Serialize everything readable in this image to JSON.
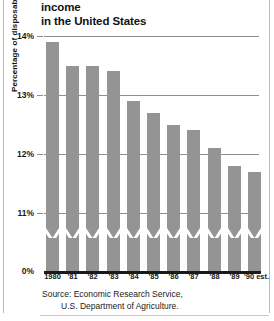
{
  "chart_data": {
    "type": "bar",
    "title": "Food spending as a percentage of income in the United States",
    "title_line1": "Food spending as a percentage of income",
    "title_line2": "in the United States",
    "xlabel": "",
    "ylabel": "Percentage of disposable income",
    "categories": [
      "1980",
      "'81",
      "'82",
      "'83",
      "'84",
      "'85",
      "'86",
      "'87",
      "'88",
      "'89",
      "'90 est."
    ],
    "values": [
      13.9,
      13.5,
      13.5,
      13.4,
      12.9,
      12.7,
      12.5,
      12.4,
      12.1,
      11.8,
      11.7
    ],
    "ylim": [
      10.6,
      14.0
    ],
    "ytick_labels": [
      "14%",
      "13%",
      "12%",
      "11%",
      "0%"
    ],
    "ytick_values": [
      14,
      13,
      12,
      11,
      0
    ],
    "grid": true,
    "axis_break": true,
    "axis_break_note": "zigzag break in bars above the 0% baseline",
    "legend": "none",
    "source_line1": "Source: Economic Research Service,",
    "source_line2": "U.S. Department of Agriculture.",
    "bar_color": "#949494",
    "gridline_color": "#8f8f8f",
    "baseline_color": "#1a1a1a",
    "background_color": "#ffffff"
  },
  "axis": {
    "y": {
      "t14": "14%",
      "t13": "13%",
      "t12": "12%",
      "t11": "11%",
      "t0": "0%",
      "title": "Percentage of disposable income"
    }
  }
}
